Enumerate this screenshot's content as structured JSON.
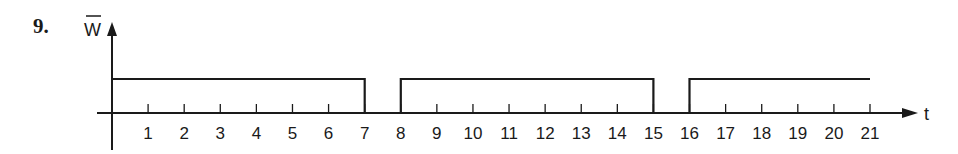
{
  "problem_number": "9.",
  "chart_data": {
    "type": "line",
    "title": "",
    "xlabel": "t",
    "ylabel": "W̄",
    "x_ticks": [
      1,
      2,
      3,
      4,
      5,
      6,
      7,
      8,
      9,
      10,
      11,
      12,
      13,
      14,
      15,
      16,
      17,
      18,
      19,
      20,
      21
    ],
    "xlim": [
      0,
      21
    ],
    "grid": false,
    "legend": null,
    "series": [
      {
        "name": "W̄",
        "description": "Binary pulse waveform: high on [0,7], [8,15], [16,21]; low on (7,8), (15,16)",
        "x": [
          0,
          7,
          7,
          8,
          8,
          15,
          15,
          16,
          16,
          21
        ],
        "values": [
          1,
          1,
          0,
          0,
          1,
          1,
          0,
          0,
          1,
          1
        ]
      }
    ],
    "high_intervals": [
      [
        0,
        7
      ],
      [
        8,
        15
      ],
      [
        16,
        21
      ]
    ],
    "low_intervals": [
      [
        7,
        8
      ],
      [
        15,
        16
      ]
    ]
  },
  "labels": {
    "y_axis": "W",
    "x_axis": "t"
  }
}
